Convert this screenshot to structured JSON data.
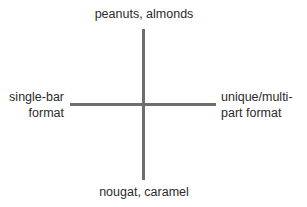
{
  "diagram": {
    "type": "quadrant-axes",
    "axis_color": "#6e6e6e",
    "text_color": "#2b2b2b",
    "vertical_axis": {
      "top_label": "peanuts, almonds",
      "bottom_label": "nougat, caramel"
    },
    "horizontal_axis": {
      "left_label_lines": [
        "single-bar",
        "format"
      ],
      "right_label_lines": [
        "unique/multi-",
        "part format"
      ]
    }
  }
}
